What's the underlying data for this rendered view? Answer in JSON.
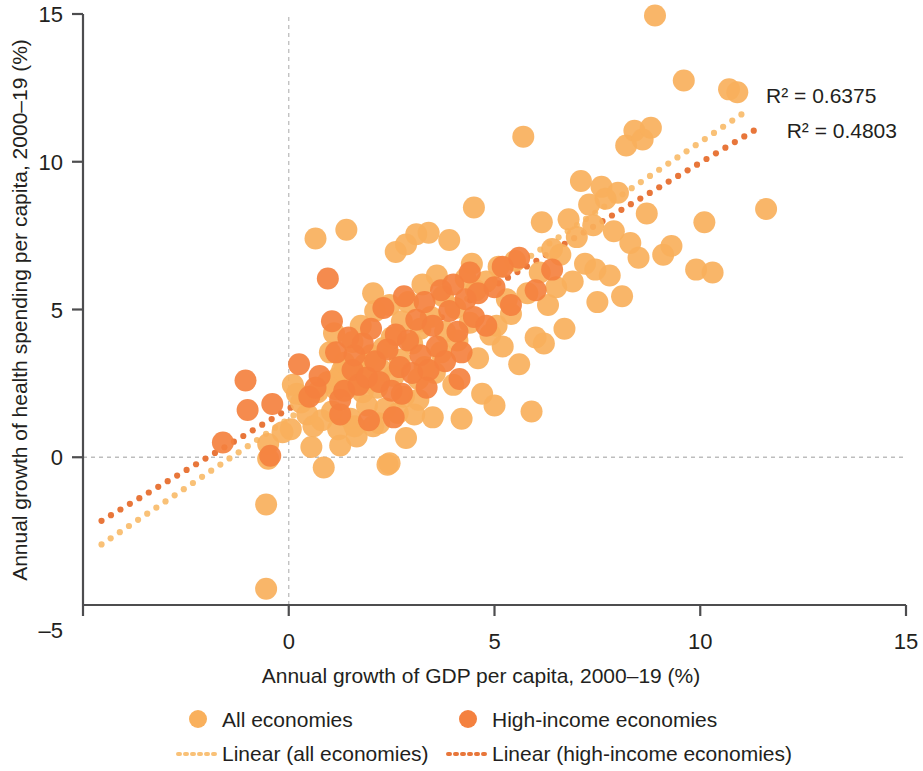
{
  "chart_data": {
    "type": "scatter",
    "title": "",
    "xlabel": "Annual growth of GDP per capita, 2000–19 (%)",
    "ylabel": "Annual growth of health spending per capita, 2000–19 (%)",
    "xlim": [
      -5,
      15
    ],
    "ylim": [
      -5,
      15
    ],
    "xticks": [
      -5,
      0,
      5,
      10,
      15
    ],
    "yticks": [
      -5,
      0,
      5,
      10,
      15
    ],
    "xtick_labels": [
      "–5",
      "0",
      "5",
      "10",
      "15"
    ],
    "ytick_labels": [
      "–5",
      "0",
      "5",
      "10",
      "15"
    ],
    "grid": "reference lines at x=0 and y=0 only, light grey dashed",
    "legend_position": "below-plot",
    "colors": {
      "all_economies": "#F9B05C",
      "high_income": "#F4813F",
      "trend_all": "#F9C177",
      "trend_high_income": "#E8763A",
      "axis": "#4d4d4f",
      "gridline": "#bdbdbd",
      "text": "#231f20"
    },
    "annotations": [
      {
        "name": "r2-all-economies",
        "text": "R² = 0.6375",
        "x": 11.6,
        "y": 12.0
      },
      {
        "name": "r2-high-income",
        "text": "R² = 0.4803",
        "x": 12.1,
        "y": 10.8
      }
    ],
    "trendlines": [
      {
        "name": "Linear (all economies)",
        "series": "all_economies",
        "x0": -4.55,
        "y0": -2.95,
        "x1": 11.0,
        "y1": 11.6,
        "style": "dotted",
        "color": "#F9C177"
      },
      {
        "name": "Linear (high-income economies)",
        "series": "high_income",
        "x0": -4.55,
        "y0": -2.15,
        "x1": 11.3,
        "y1": 11.05,
        "style": "dotted",
        "color": "#E8763A"
      }
    ],
    "legend": [
      {
        "name": "All economies",
        "marker": "circle",
        "color": "#F9B05C"
      },
      {
        "name": "High-income economies",
        "marker": "circle",
        "color": "#F4813F"
      },
      {
        "name": "Linear (all economies)",
        "marker": "dotted-line",
        "color": "#F9C177"
      },
      {
        "name": "Linear (high-income economies)",
        "marker": "dotted-line",
        "color": "#E8763A"
      }
    ],
    "series": [
      {
        "name": "All economies",
        "color": "#F9B05C",
        "marker_radius_px": 11,
        "points": [
          [
            -0.55,
            -4.45
          ],
          [
            -0.55,
            -1.6
          ],
          [
            -0.5,
            -0.05
          ],
          [
            -0.5,
            0.45
          ],
          [
            -0.15,
            0.85
          ],
          [
            0.2,
            2.15
          ],
          [
            0.3,
            1.85
          ],
          [
            0.45,
            1.45
          ],
          [
            0.55,
            0.35
          ],
          [
            0.6,
            1.05
          ],
          [
            0.65,
            7.4
          ],
          [
            0.7,
            2.2
          ],
          [
            0.8,
            1.25
          ],
          [
            0.85,
            -0.35
          ],
          [
            0.95,
            2.55
          ],
          [
            1.0,
            3.55
          ],
          [
            1.05,
            1.55
          ],
          [
            1.1,
            4.2
          ],
          [
            1.15,
            2.3
          ],
          [
            1.2,
            2.7
          ],
          [
            1.25,
            0.4
          ],
          [
            1.3,
            2.95
          ],
          [
            1.35,
            3.2
          ],
          [
            1.4,
            7.7
          ],
          [
            1.45,
            2.4
          ],
          [
            1.5,
            1.3
          ],
          [
            1.55,
            3.9
          ],
          [
            1.6,
            2.5
          ],
          [
            1.65,
            0.7
          ],
          [
            1.7,
            2.85
          ],
          [
            1.75,
            4.45
          ],
          [
            1.8,
            2.2
          ],
          [
            1.85,
            3.15
          ],
          [
            1.9,
            1.75
          ],
          [
            1.95,
            2.6
          ],
          [
            2.0,
            3.45
          ],
          [
            2.05,
            5.55
          ],
          [
            2.1,
            4.95
          ],
          [
            2.15,
            2.35
          ],
          [
            2.2,
            1.15
          ],
          [
            2.25,
            2.95
          ],
          [
            2.3,
            3.7
          ],
          [
            2.35,
            1.65
          ],
          [
            2.4,
            -0.25
          ],
          [
            2.45,
            5.15
          ],
          [
            2.5,
            4.05
          ],
          [
            2.55,
            2.75
          ],
          [
            2.6,
            6.95
          ],
          [
            2.65,
            1.5
          ],
          [
            2.7,
            3.3
          ],
          [
            2.75,
            4.6
          ],
          [
            2.8,
            2.05
          ],
          [
            2.85,
            7.2
          ],
          [
            2.9,
            5.25
          ],
          [
            3.0,
            3.85
          ],
          [
            3.05,
            1.45
          ],
          [
            3.1,
            7.55
          ],
          [
            3.15,
            2.65
          ],
          [
            3.2,
            4.35
          ],
          [
            3.25,
            5.85
          ],
          [
            3.3,
            3.05
          ],
          [
            3.4,
            7.6
          ],
          [
            3.45,
            4.75
          ],
          [
            3.5,
            1.35
          ],
          [
            3.55,
            2.85
          ],
          [
            3.6,
            6.15
          ],
          [
            3.7,
            3.55
          ],
          [
            3.75,
            5.45
          ],
          [
            3.8,
            4.25
          ],
          [
            3.9,
            7.35
          ],
          [
            4.0,
            2.45
          ],
          [
            4.05,
            5.05
          ],
          [
            4.1,
            3.95
          ],
          [
            4.2,
            1.3
          ],
          [
            4.3,
            6.05
          ],
          [
            4.4,
            4.55
          ],
          [
            4.5,
            8.45
          ],
          [
            4.55,
            5.65
          ],
          [
            4.6,
            3.35
          ],
          [
            4.7,
            2.15
          ],
          [
            4.8,
            5.95
          ],
          [
            4.9,
            4.15
          ],
          [
            5.0,
            1.75
          ],
          [
            5.1,
            6.45
          ],
          [
            5.2,
            3.75
          ],
          [
            5.3,
            5.35
          ],
          [
            5.4,
            4.85
          ],
          [
            5.5,
            6.65
          ],
          [
            5.6,
            3.15
          ],
          [
            5.7,
            10.85
          ],
          [
            5.8,
            5.55
          ],
          [
            5.9,
            1.55
          ],
          [
            6.0,
            4.05
          ],
          [
            6.1,
            6.25
          ],
          [
            6.2,
            3.85
          ],
          [
            6.3,
            5.15
          ],
          [
            6.4,
            7.05
          ],
          [
            6.5,
            5.75
          ],
          [
            6.6,
            6.85
          ],
          [
            6.7,
            4.35
          ],
          [
            6.8,
            8.05
          ],
          [
            6.9,
            5.95
          ],
          [
            7.0,
            7.45
          ],
          [
            7.1,
            9.35
          ],
          [
            7.2,
            6.55
          ],
          [
            7.3,
            8.55
          ],
          [
            7.4,
            7.85
          ],
          [
            7.5,
            5.25
          ],
          [
            7.6,
            9.15
          ],
          [
            7.7,
            8.75
          ],
          [
            7.8,
            6.15
          ],
          [
            7.9,
            7.65
          ],
          [
            8.0,
            8.95
          ],
          [
            8.1,
            5.45
          ],
          [
            8.2,
            10.55
          ],
          [
            8.3,
            7.25
          ],
          [
            8.4,
            11.05
          ],
          [
            8.5,
            6.75
          ],
          [
            8.6,
            10.75
          ],
          [
            8.7,
            8.25
          ],
          [
            8.8,
            11.15
          ],
          [
            8.9,
            14.95
          ],
          [
            9.1,
            6.85
          ],
          [
            9.3,
            7.15
          ],
          [
            9.6,
            12.75
          ],
          [
            9.9,
            6.35
          ],
          [
            10.1,
            7.95
          ],
          [
            10.3,
            6.25
          ],
          [
            10.7,
            12.45
          ],
          [
            10.9,
            12.35
          ],
          [
            11.6,
            8.4
          ],
          [
            0.05,
            0.95
          ],
          [
            0.1,
            2.45
          ],
          [
            2.05,
            1.05
          ],
          [
            2.45,
            -0.2
          ],
          [
            1.2,
            0.95
          ],
          [
            1.6,
            1.05
          ],
          [
            3.15,
            1.95
          ],
          [
            2.85,
            0.65
          ],
          [
            5.05,
            4.45
          ],
          [
            4.45,
            6.55
          ],
          [
            6.15,
            7.95
          ],
          [
            7.45,
            6.35
          ]
        ]
      },
      {
        "name": "High-income economies",
        "color": "#F4813F",
        "marker_radius_px": 11,
        "points": [
          [
            -1.6,
            0.5
          ],
          [
            -1.05,
            2.6
          ],
          [
            -1.0,
            1.6
          ],
          [
            -0.4,
            1.8
          ],
          [
            0.25,
            3.15
          ],
          [
            0.5,
            2.05
          ],
          [
            0.75,
            2.75
          ],
          [
            0.95,
            6.05
          ],
          [
            1.05,
            4.6
          ],
          [
            1.15,
            3.55
          ],
          [
            1.25,
            1.95
          ],
          [
            1.35,
            2.25
          ],
          [
            1.45,
            4.05
          ],
          [
            1.55,
            2.95
          ],
          [
            1.6,
            3.45
          ],
          [
            1.7,
            2.45
          ],
          [
            1.8,
            3.85
          ],
          [
            1.9,
            2.7
          ],
          [
            2.0,
            4.35
          ],
          [
            2.1,
            3.25
          ],
          [
            2.2,
            2.55
          ],
          [
            2.3,
            5.05
          ],
          [
            2.4,
            3.65
          ],
          [
            2.5,
            2.25
          ],
          [
            2.6,
            4.15
          ],
          [
            2.7,
            3.05
          ],
          [
            2.8,
            5.45
          ],
          [
            2.9,
            3.95
          ],
          [
            3.0,
            2.85
          ],
          [
            3.1,
            4.65
          ],
          [
            3.2,
            3.45
          ],
          [
            3.3,
            5.25
          ],
          [
            3.4,
            2.95
          ],
          [
            3.5,
            4.45
          ],
          [
            3.6,
            3.75
          ],
          [
            3.7,
            5.65
          ],
          [
            3.8,
            3.25
          ],
          [
            3.9,
            4.95
          ],
          [
            4.0,
            5.85
          ],
          [
            4.1,
            4.25
          ],
          [
            4.2,
            3.55
          ],
          [
            4.3,
            5.35
          ],
          [
            4.4,
            6.25
          ],
          [
            4.5,
            4.75
          ],
          [
            4.6,
            5.55
          ],
          [
            4.8,
            4.45
          ],
          [
            5.0,
            5.75
          ],
          [
            5.2,
            6.45
          ],
          [
            5.4,
            5.15
          ],
          [
            5.6,
            6.75
          ],
          [
            6.0,
            5.65
          ],
          [
            6.4,
            6.35
          ],
          [
            1.25,
            1.45
          ],
          [
            1.95,
            1.25
          ],
          [
            2.55,
            1.35
          ],
          [
            0.65,
            2.35
          ],
          [
            -0.45,
            0.05
          ],
          [
            2.75,
            2.15
          ],
          [
            3.35,
            2.35
          ],
          [
            4.15,
            2.65
          ]
        ]
      }
    ]
  },
  "legend_labels": {
    "all_economies": "All economies",
    "high_income": "High-income economies",
    "linear_all": "Linear (all economies)",
    "linear_high": "Linear (high-income economies)"
  },
  "axes": {
    "x_title": "Annual growth of GDP per capita, 2000–19 (%)",
    "y_title": "Annual growth of health spending per capita, 2000–19 (%)"
  },
  "annotations": {
    "r2_all": "R² = 0.6375",
    "r2_high": "R² = 0.4803"
  }
}
